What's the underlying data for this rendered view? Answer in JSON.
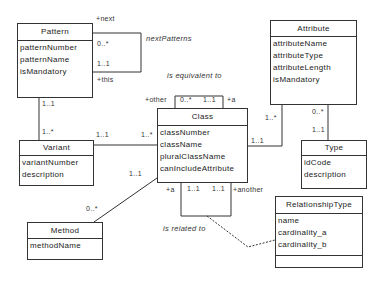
{
  "diagram": {
    "type": "UML class diagram",
    "classes": {
      "pattern": {
        "name": "Pattern",
        "attributes": [
          "patternNumber",
          "patternName",
          "isMandatory"
        ]
      },
      "attribute": {
        "name": "Attribute",
        "attributes": [
          "attributeName",
          "attributeType",
          "attributeLength",
          "isMandatory"
        ]
      },
      "variant": {
        "name": "Variant",
        "attributes": [
          "variantNumber",
          "description"
        ]
      },
      "class": {
        "name": "Class",
        "attributes": [
          "classNumber",
          "className",
          "pluralClassName",
          "canIncludeAttribute"
        ]
      },
      "type": {
        "name": "Type",
        "attributes": [
          "idCode",
          "description"
        ]
      },
      "method": {
        "name": "Method",
        "attributes": [
          "methodName"
        ]
      },
      "relationshipType": {
        "name": "RelationshipType",
        "attributes": [
          "name",
          "cardinality_a",
          "cardinality_b"
        ]
      }
    },
    "associations": {
      "nextPatterns": {
        "name": "nextPatterns",
        "role_top": "+next",
        "mult_top": "0..*",
        "role_bottom": "+this",
        "mult_bottom": "1..1"
      },
      "isEquivalentTo": {
        "name": "is equivalent to",
        "role_left": "+other",
        "mult_left": "0..*",
        "mult_right": "1..1",
        "role_right": "+a"
      },
      "patternVariant": {
        "mult_pattern": "1..1",
        "mult_variant": "1..*"
      },
      "variantClass": {
        "mult_variant": "1..1",
        "mult_class": "1..*"
      },
      "classAttribute": {
        "mult_attribute": "1..*",
        "mult_class": "1..1"
      },
      "attributeType": {
        "mult_attribute": "0..*",
        "mult_type": "1..1"
      },
      "classMethod": {
        "mult_class": "1..1",
        "mult_method": "0..*"
      },
      "isRelatedTo": {
        "name": "is related to",
        "role_left": "+a",
        "mult_left": "1..1",
        "mult_right": "1..1",
        "role_right": "+another"
      }
    }
  }
}
